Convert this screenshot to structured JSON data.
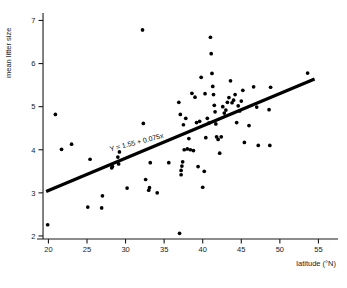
{
  "chart_data": {
    "type": "scatter",
    "title": "",
    "xlabel": "latitude (°N)",
    "ylabel": "mean litter size",
    "xlim": [
      18.0,
      56.5
    ],
    "ylim": [
      1.72,
      7.15
    ],
    "xticks": [
      20,
      25,
      30,
      35,
      40,
      45,
      50,
      55
    ],
    "yticks": [
      2,
      3,
      4,
      5,
      6,
      7
    ],
    "xtick_labels": [
      "20",
      "25",
      "30",
      "35",
      "40",
      "45",
      "50",
      "55"
    ],
    "ytick_labels": [
      "2",
      "3",
      "4",
      "5",
      "6",
      "7"
    ],
    "grid": false,
    "legend": null,
    "annotations": [
      {
        "text": "Y = 1.55 + 0.075x",
        "x": 31.5,
        "y": 4.12,
        "rotation": -14.5
      }
    ],
    "trendline": {
      "equation": "Y = 1.55 + 0.075x",
      "intercept": 1.55,
      "slope": 0.075,
      "x_start": 19.7,
      "x_end": 54.5,
      "y_start": 3.03,
      "y_end": 5.64
    },
    "x": [
      19.9,
      20.9,
      21.7,
      23.0,
      25.1,
      25.4,
      26.9,
      27.0,
      29.0,
      29.1,
      29.2,
      28.2,
      28.3,
      30.2,
      32.2,
      32.3,
      32.6,
      33.0,
      33.1,
      33.2,
      34.1,
      35.6,
      36.9,
      37.0,
      37.1,
      37.2,
      37.2,
      37.3,
      37.4,
      37.5,
      37.6,
      37.8,
      38.0,
      38.2,
      38.4,
      38.6,
      38.8,
      39.0,
      39.2,
      39.4,
      39.6,
      39.8,
      40.0,
      40.2,
      40.3,
      40.4,
      40.6,
      40.8,
      41.0,
      41.1,
      41.2,
      41.3,
      41.4,
      41.5,
      41.6,
      41.7,
      41.8,
      42.0,
      42.2,
      42.4,
      42.6,
      42.8,
      43.0,
      43.2,
      43.4,
      43.6,
      43.8,
      44.0,
      44.2,
      44.4,
      44.6,
      44.8,
      45.0,
      45.2,
      45.4,
      46.0,
      46.6,
      47.0,
      47.2,
      48.6,
      48.7,
      48.8,
      53.6
    ],
    "y": [
      2.26,
      4.82,
      4.01,
      4.13,
      2.67,
      3.78,
      2.65,
      2.93,
      3.83,
      3.67,
      3.95,
      3.58,
      3.61,
      3.11,
      6.78,
      4.61,
      3.31,
      3.06,
      3.12,
      3.7,
      3.0,
      3.7,
      5.1,
      2.06,
      4.82,
      3.42,
      3.52,
      3.62,
      3.72,
      4.58,
      4.0,
      4.73,
      4.02,
      4.26,
      4.0,
      5.31,
      3.98,
      5.22,
      4.63,
      3.61,
      4.66,
      5.68,
      3.13,
      3.5,
      5.3,
      4.28,
      4.73,
      4.62,
      6.61,
      6.23,
      5.77,
      5.47,
      5.28,
      5.03,
      4.88,
      4.6,
      4.3,
      4.24,
      3.92,
      4.3,
      5.0,
      4.85,
      4.92,
      5.1,
      5.21,
      5.6,
      5.09,
      5.15,
      5.28,
      4.63,
      5.02,
      4.9,
      5.13,
      5.38,
      4.17,
      4.56,
      5.46,
      4.99,
      4.1,
      4.93,
      4.1,
      5.45,
      5.78
    ]
  }
}
